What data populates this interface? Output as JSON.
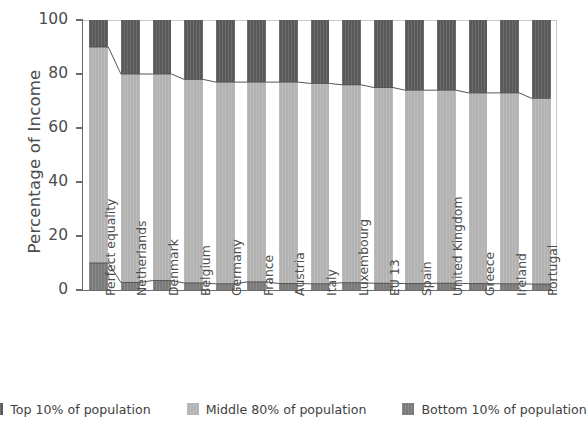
{
  "chart_data": {
    "type": "bar",
    "subtype": "stacked-bar-100-percent",
    "title": "",
    "xlabel": "",
    "ylabel": "Percentage of Income",
    "ylim": [
      0,
      100
    ],
    "yticks": [
      0,
      20,
      40,
      60,
      80,
      100
    ],
    "grid": false,
    "legend_position": "bottom",
    "categories": [
      "Perfect equality",
      "Netherlands",
      "Denmark",
      "Belgium",
      "Germany",
      "France",
      "Austria",
      "Italy",
      "Luxembourg",
      "EU 13",
      "Spain",
      "United Kingdom",
      "Greece",
      "Ireland",
      "Portugal"
    ],
    "series": [
      {
        "name": "Bottom 10% of population",
        "color": "#7a7a7a",
        "values": [
          10.0,
          2.8,
          3.5,
          2.6,
          2.3,
          3.0,
          2.4,
          2.3,
          2.7,
          2.5,
          2.4,
          2.5,
          2.4,
          2.3,
          2.2
        ]
      },
      {
        "name": "Middle 80% of population",
        "color": "#b3b3b3",
        "values": [
          80.0,
          77.2,
          76.5,
          75.4,
          74.7,
          74.0,
          74.6,
          74.2,
          73.3,
          72.5,
          71.6,
          71.5,
          70.6,
          70.7,
          68.8
        ]
      },
      {
        "name": "Top 10% of population",
        "color": "#595959",
        "values": [
          10.0,
          20.0,
          20.0,
          22.0,
          23.0,
          23.0,
          23.0,
          23.5,
          24.0,
          25.0,
          26.0,
          26.0,
          27.0,
          27.0,
          29.0
        ]
      }
    ],
    "boundary_lines": [
      {
        "name": "bottom-10-boundary",
        "values": [
          10.0,
          2.8,
          3.5,
          2.6,
          2.3,
          3.0,
          2.4,
          2.3,
          2.7,
          2.5,
          2.4,
          2.5,
          2.4,
          2.3,
          2.2
        ]
      },
      {
        "name": "top-10-boundary",
        "values": [
          90.0,
          80.0,
          80.0,
          78.0,
          77.0,
          77.0,
          77.0,
          76.5,
          76.0,
          75.0,
          74.0,
          74.0,
          73.0,
          73.0,
          71.0
        ]
      }
    ]
  },
  "axis": {
    "ylabel": "Percentage of Income",
    "ytick_labels": [
      "0",
      "20",
      "40",
      "60",
      "80",
      "100"
    ]
  },
  "legend": {
    "items": [
      {
        "label": "Top 10% of population",
        "color": "#595959"
      },
      {
        "label": "Middle 80% of population",
        "color": "#b3b3b3"
      },
      {
        "label": "Bottom 10% of population",
        "color": "#7a7a7a"
      }
    ]
  },
  "colors": {
    "top": "#595959",
    "middle": "#b3b3b3",
    "bottom": "#7a7a7a",
    "axis": "#6b6b6b",
    "text": "#4d4d4d",
    "connector": "#555555",
    "background": "#ffffff"
  }
}
